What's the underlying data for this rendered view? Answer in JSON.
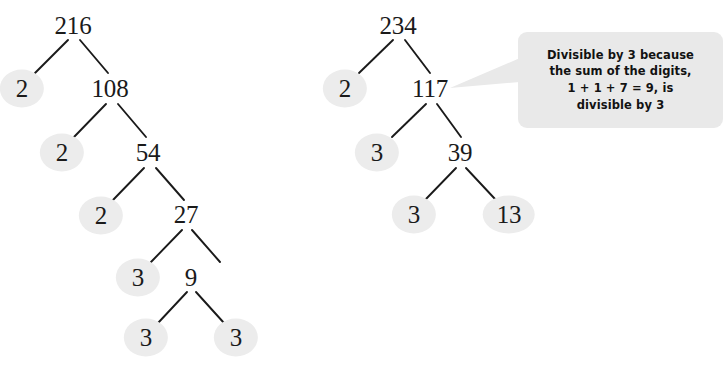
{
  "diagram": {
    "background_color": "#ffffff",
    "prime_highlight_color": "#ececec",
    "edge_color": "#1a1a1a",
    "callout_bg_color": "#e9e9e9"
  },
  "trees": [
    {
      "id": "tree-216",
      "root_value": "216",
      "nodes": [
        {
          "id": "n216",
          "label": "216",
          "x": 73,
          "y": 25,
          "prime": false,
          "rx": 30,
          "ry": 19
        },
        {
          "id": "n2a",
          "label": "2",
          "x": 22,
          "y": 88,
          "prime": true,
          "rx": 22,
          "ry": 19
        },
        {
          "id": "n108",
          "label": "108",
          "x": 110,
          "y": 88,
          "prime": false,
          "rx": 30,
          "ry": 19
        },
        {
          "id": "n2b",
          "label": "2",
          "x": 62,
          "y": 152,
          "prime": true,
          "rx": 22,
          "ry": 19
        },
        {
          "id": "n54",
          "label": "54",
          "x": 148,
          "y": 152,
          "prime": false,
          "rx": 26,
          "ry": 19
        },
        {
          "id": "n2c",
          "label": "2",
          "x": 101,
          "y": 215,
          "prime": true,
          "rx": 22,
          "ry": 19
        },
        {
          "id": "n27",
          "label": "27",
          "x": 186,
          "y": 214,
          "prime": false,
          "rx": 26,
          "ry": 19
        },
        {
          "id": "n3a",
          "label": "3",
          "x": 138,
          "y": 277,
          "prime": true,
          "rx": 22,
          "ry": 19
        },
        {
          "id": "n9",
          "label": "9",
          "x": 191,
          "y": 277,
          "prime": false,
          "rx": 20,
          "ry": 19
        },
        {
          "id": "n3b",
          "label": "3",
          "x": 146,
          "y": 337,
          "prime": true,
          "rx": 22,
          "ry": 19
        },
        {
          "id": "n3c",
          "label": "3",
          "x": 236,
          "y": 337,
          "prime": true,
          "rx": 22,
          "ry": 19
        }
      ],
      "edges": [
        {
          "x1": 68,
          "y1": 40,
          "x2": 35,
          "y2": 73
        },
        {
          "x1": 80,
          "y1": 40,
          "x2": 108,
          "y2": 73
        },
        {
          "x1": 106,
          "y1": 104,
          "x2": 74,
          "y2": 137
        },
        {
          "x1": 118,
          "y1": 104,
          "x2": 146,
          "y2": 137
        },
        {
          "x1": 144,
          "y1": 168,
          "x2": 113,
          "y2": 200
        },
        {
          "x1": 156,
          "y1": 168,
          "x2": 184,
          "y2": 200
        },
        {
          "x1": 182,
          "y1": 230,
          "x2": 151,
          "y2": 262
        },
        {
          "x1": 192,
          "y1": 230,
          "x2": 220,
          "y2": 262
        },
        {
          "x1": 187,
          "y1": 292,
          "x2": 158,
          "y2": 323
        },
        {
          "x1": 196,
          "y1": 292,
          "x2": 224,
          "y2": 323
        }
      ]
    },
    {
      "id": "tree-234",
      "root_value": "234",
      "nodes": [
        {
          "id": "m234",
          "label": "234",
          "x": 398,
          "y": 25,
          "prime": false,
          "rx": 30,
          "ry": 19
        },
        {
          "id": "m2",
          "label": "2",
          "x": 345,
          "y": 88,
          "prime": true,
          "rx": 22,
          "ry": 19
        },
        {
          "id": "m117",
          "label": "117",
          "x": 430,
          "y": 88,
          "prime": false,
          "rx": 30,
          "ry": 19
        },
        {
          "id": "m3a",
          "label": "3",
          "x": 377,
          "y": 152,
          "prime": true,
          "rx": 22,
          "ry": 19
        },
        {
          "id": "m39",
          "label": "39",
          "x": 460,
          "y": 152,
          "prime": false,
          "rx": 26,
          "ry": 19
        },
        {
          "id": "m3b",
          "label": "3",
          "x": 414,
          "y": 214,
          "prime": true,
          "rx": 22,
          "ry": 19
        },
        {
          "id": "m13",
          "label": "13",
          "x": 509,
          "y": 214,
          "prime": true,
          "rx": 26,
          "ry": 19
        }
      ],
      "edges": [
        {
          "x1": 393,
          "y1": 40,
          "x2": 359,
          "y2": 73
        },
        {
          "x1": 405,
          "y1": 40,
          "x2": 430,
          "y2": 73
        },
        {
          "x1": 426,
          "y1": 104,
          "x2": 392,
          "y2": 137
        },
        {
          "x1": 437,
          "y1": 104,
          "x2": 461,
          "y2": 137
        },
        {
          "x1": 456,
          "y1": 168,
          "x2": 426,
          "y2": 199
        },
        {
          "x1": 466,
          "y1": 168,
          "x2": 495,
          "y2": 199
        }
      ]
    }
  ],
  "callout": {
    "lines": [
      "Divisible by 3 because",
      "the sum of the digits,",
      "1 + 1 + 7 = 9, is",
      "divisible by 3"
    ],
    "box": {
      "x": 518,
      "y": 32,
      "width": 205,
      "height": 96
    },
    "tail": {
      "tip_x": 450,
      "tip_y": 88,
      "base_top_y": 58,
      "base_bottom_y": 82
    }
  }
}
